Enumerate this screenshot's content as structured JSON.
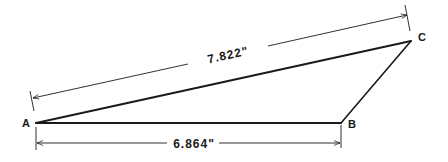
{
  "diagram": {
    "type": "triangle-dimension-drawing",
    "colors": {
      "stroke": "#1a1a1a",
      "background": "#ffffff"
    },
    "vertices": [
      {
        "id": "A",
        "label": "A",
        "x": 36,
        "y": 123
      },
      {
        "id": "B",
        "label": "B",
        "x": 341,
        "y": 123
      },
      {
        "id": "C",
        "label": "C",
        "x": 411,
        "y": 41
      }
    ],
    "edges": [
      {
        "from": "A",
        "to": "B"
      },
      {
        "from": "B",
        "to": "C"
      },
      {
        "from": "A",
        "to": "C"
      }
    ],
    "dimensions": {
      "ac": {
        "label": "7.822\"",
        "between": [
          "A",
          "C"
        ]
      },
      "ab": {
        "label": "6.864\"",
        "between": [
          "A",
          "B"
        ]
      }
    }
  }
}
